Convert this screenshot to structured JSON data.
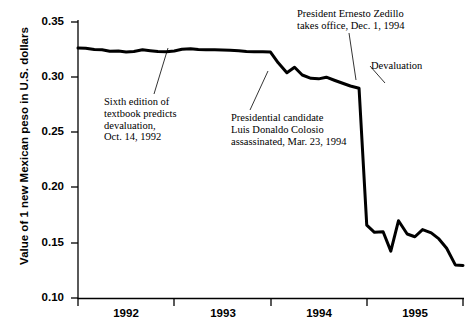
{
  "chart_data": {
    "type": "line",
    "title": "",
    "xlabel": "",
    "ylabel": "Value of 1 new Mexican peso in U.S. dollars",
    "ylim": [
      0.1,
      0.35
    ],
    "xlim": [
      1992.0,
      1996.0
    ],
    "grid": false,
    "legend": false,
    "ytick_labels": [
      "0.35",
      "0.30",
      "0.25",
      "0.20",
      "0.15",
      "0.10"
    ],
    "ytick_values": [
      0.35,
      0.3,
      0.25,
      0.2,
      0.15,
      0.1
    ],
    "xtick_labels": [
      "1992",
      "1993",
      "1994",
      "1995"
    ],
    "xtick_values": [
      1992.0,
      1993.0,
      1994.0,
      1995.0,
      1996.0
    ],
    "series": [
      {
        "name": "New Mexican peso value",
        "x": [
          1992.0,
          1992.08,
          1992.17,
          1992.25,
          1992.33,
          1992.42,
          1992.5,
          1992.58,
          1992.67,
          1992.75,
          1992.83,
          1992.92,
          1993.0,
          1993.08,
          1993.17,
          1993.25,
          1993.33,
          1993.42,
          1993.5,
          1993.58,
          1993.67,
          1993.75,
          1993.83,
          1993.92,
          1994.0,
          1994.08,
          1994.17,
          1994.25,
          1994.33,
          1994.42,
          1994.5,
          1994.58,
          1994.67,
          1994.75,
          1994.83,
          1994.92,
          1995.0,
          1995.08,
          1995.17,
          1995.25,
          1995.33,
          1995.42,
          1995.5,
          1995.58,
          1995.67,
          1995.75,
          1995.83,
          1995.92,
          1996.0
        ],
        "y": [
          0.3265,
          0.3263,
          0.325,
          0.3248,
          0.3235,
          0.3238,
          0.3229,
          0.3233,
          0.3248,
          0.324,
          0.3232,
          0.323,
          0.3238,
          0.3253,
          0.3258,
          0.325,
          0.3248,
          0.3248,
          0.3247,
          0.3245,
          0.324,
          0.3232,
          0.323,
          0.323,
          0.3228,
          0.313,
          0.304,
          0.309,
          0.302,
          0.299,
          0.2985,
          0.3,
          0.297,
          0.2945,
          0.292,
          0.29,
          0.166,
          0.1595,
          0.16,
          0.1425,
          0.17,
          0.158,
          0.1555,
          0.162,
          0.159,
          0.1535,
          0.145,
          0.13,
          0.1295
        ],
        "color": "#000000",
        "linewidth": 3
      }
    ],
    "annotations": [
      {
        "name": "sixth-edition",
        "text": "Sixth edition of\ntextbook predicts\ndevaluation,\nOct. 14, 1992",
        "leader_from": [
          153,
          94
        ],
        "leader_to": [
          168,
          48
        ]
      },
      {
        "name": "colosio",
        "text": "Presidential candidate\nLuis Donaldo Colosio\nassassinated, Mar. 23, 1994",
        "leader_from": [
          249,
          110
        ],
        "leader_to": [
          268,
          71
        ]
      },
      {
        "name": "zedillo",
        "text": "President Ernesto Zedillo\ntakes office, Dec. 1, 1994",
        "leader_from": [
          350,
          32
        ],
        "leader_to": [
          357,
          79
        ]
      },
      {
        "name": "devaluation",
        "text": "Devaluation",
        "leader_from": [
          369,
          66
        ],
        "leader_to": [
          385,
          83
        ]
      }
    ]
  }
}
